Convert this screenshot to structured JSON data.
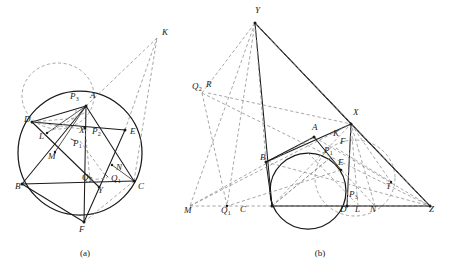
{
  "document": {
    "type": "geometry-figure-pair",
    "background_color": "#ffffff",
    "ink_color": "#1a1a1a",
    "construction_color": "#8a8a8a"
  },
  "figures": [
    {
      "id": "figure-a",
      "caption": "(a)",
      "caption_pos": [
        85,
        256
      ],
      "description": "Circle with inscribed points and auxiliary dashed circle and external point K",
      "circle": {
        "cx": 80,
        "cy": 153,
        "r": 62
      },
      "aux_circle": {
        "cx": 58,
        "cy": 96,
        "rx": 36,
        "ry": 33
      },
      "labels": [
        {
          "text": "P",
          "sub": "3",
          "x": 70,
          "y": 99
        },
        {
          "text": "A",
          "sub": "",
          "x": 90,
          "y": 98
        },
        {
          "text": "K",
          "sub": "",
          "x": 162,
          "y": 35
        },
        {
          "text": "D",
          "sub": "",
          "x": 24,
          "y": 122
        },
        {
          "text": "E",
          "sub": "",
          "x": 130,
          "y": 134
        },
        {
          "text": "L",
          "sub": "",
          "x": 39,
          "y": 139
        },
        {
          "text": "X",
          "sub": "",
          "x": 79,
          "y": 133
        },
        {
          "text": "P",
          "sub": "2",
          "x": 92,
          "y": 134
        },
        {
          "text": "P",
          "sub": "1",
          "x": 73,
          "y": 146
        },
        {
          "text": "M",
          "sub": "",
          "x": 48,
          "y": 159
        },
        {
          "text": "N",
          "sub": "",
          "x": 116,
          "y": 170
        },
        {
          "text": "Q",
          "sub": "2",
          "x": 82,
          "y": 180
        },
        {
          "text": "Q",
          "sub": "1",
          "x": 111,
          "y": 181
        },
        {
          "text": "B",
          "sub": "",
          "x": 15,
          "y": 189
        },
        {
          "text": "C",
          "sub": "",
          "x": 138,
          "y": 189
        },
        {
          "text": "Y",
          "sub": "",
          "x": 98,
          "y": 193
        },
        {
          "text": "F",
          "sub": "",
          "x": 79,
          "y": 232
        }
      ],
      "points": {
        "A": [
          86,
          106
        ],
        "D": [
          32,
          122
        ],
        "E": [
          125,
          130
        ],
        "B": [
          22,
          184
        ],
        "C": [
          134,
          181
        ],
        "F": [
          84,
          222
        ],
        "L": [
          47,
          133
        ],
        "M": [
          55,
          152
        ],
        "N": [
          112,
          165
        ],
        "X": [
          85,
          128
        ],
        "Y": [
          99,
          187
        ],
        "K": [
          157,
          38
        ],
        "Q1": [
          107,
          178
        ],
        "Q2": [
          90,
          180
        ],
        "P1": [
          80,
          141
        ],
        "P2": [
          88,
          130
        ],
        "P3": [
          76,
          110
        ]
      }
    },
    {
      "id": "figure-b",
      "caption": "(b)",
      "caption_pos": [
        320,
        256
      ],
      "description": "Triangle with incircle, external point Z, apex Y, point X and tangent constructions",
      "incircle": {
        "cx": 308,
        "cy": 191,
        "r": 38
      },
      "aux_circle": {
        "cx": 355,
        "cy": 178,
        "rx": 40,
        "ry": 38
      },
      "labels": [
        {
          "text": "Y",
          "sub": "",
          "x": 255,
          "y": 13
        },
        {
          "text": "X",
          "sub": "",
          "x": 353,
          "y": 115
        },
        {
          "text": "Q",
          "sub": "2",
          "x": 192,
          "y": 89
        },
        {
          "text": "R",
          "sub": "",
          "x": 206,
          "y": 87
        },
        {
          "text": "A",
          "sub": "",
          "x": 312,
          "y": 130
        },
        {
          "text": "K",
          "sub": "",
          "x": 333,
          "y": 136
        },
        {
          "text": "F",
          "sub": "",
          "x": 340,
          "y": 144
        },
        {
          "text": "B",
          "sub": "",
          "x": 260,
          "y": 160
        },
        {
          "text": "P",
          "sub": "1",
          "x": 324,
          "y": 153
        },
        {
          "text": "E",
          "sub": "",
          "x": 338,
          "y": 165
        },
        {
          "text": "T",
          "sub": "",
          "x": 386,
          "y": 189
        },
        {
          "text": "P",
          "sub": "3",
          "x": 349,
          "y": 197
        },
        {
          "text": "M",
          "sub": "",
          "x": 184,
          "y": 213
        },
        {
          "text": "Q",
          "sub": "1",
          "x": 221,
          "y": 213
        },
        {
          "text": "C",
          "sub": "",
          "x": 240,
          "y": 212
        },
        {
          "text": "D",
          "sub": "",
          "x": 340,
          "y": 212
        },
        {
          "text": "L",
          "sub": "",
          "x": 355,
          "y": 212
        },
        {
          "text": "N",
          "sub": "",
          "x": 370,
          "y": 212
        },
        {
          "text": "Z",
          "sub": "",
          "x": 429,
          "y": 212
        }
      ],
      "points": {
        "Y": [
          255,
          23
        ],
        "X": [
          351,
          124
        ],
        "A": [
          314,
          137
        ],
        "B": [
          266,
          162
        ],
        "C": [
          272,
          206
        ],
        "D": [
          347,
          206
        ],
        "E": [
          341,
          170
        ],
        "F": [
          336,
          148
        ],
        "K": [
          330,
          142
        ],
        "L": [
          358,
          206
        ],
        "N": [
          375,
          206
        ],
        "M": [
          192,
          206
        ],
        "T": [
          391,
          182
        ],
        "Z": [
          430,
          206
        ],
        "Q1": [
          227,
          206
        ],
        "Q2": [
          202,
          93
        ],
        "R": [
          208,
          93
        ],
        "P1": [
          330,
          158
        ],
        "P3": [
          355,
          202
        ]
      }
    }
  ]
}
